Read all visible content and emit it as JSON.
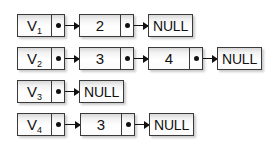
{
  "diagram": {
    "null_label": "NULL",
    "colors": {
      "box_border": "#3a3a3a",
      "box_fill_top": "#d8d8d8",
      "box_fill_bottom": "#ffffff",
      "text": "#111111",
      "arrow": "#111111",
      "background": "#ffffff"
    },
    "rows": [
      {
        "head": {
          "label": "V",
          "subscript": "1"
        },
        "nodes": [
          {
            "value": "2"
          }
        ],
        "terminator": "NULL"
      },
      {
        "head": {
          "label": "V",
          "subscript": "2"
        },
        "nodes": [
          {
            "value": "3"
          },
          {
            "value": "4"
          }
        ],
        "terminator": "NULL"
      },
      {
        "head": {
          "label": "V",
          "subscript": "3"
        },
        "nodes": [],
        "terminator": "NULL"
      },
      {
        "head": {
          "label": "V",
          "subscript": "4"
        },
        "nodes": [
          {
            "value": "3"
          }
        ],
        "terminator": "NULL"
      }
    ]
  }
}
